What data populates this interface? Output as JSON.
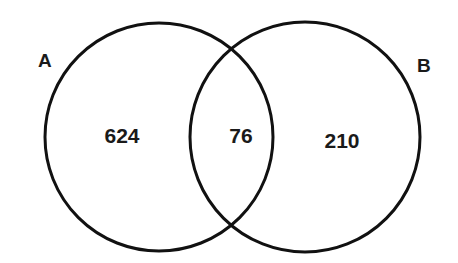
{
  "diagram": {
    "type": "venn",
    "sets": [
      {
        "label": "A",
        "only_count": "624"
      },
      {
        "label": "B",
        "only_count": "210"
      }
    ],
    "intersection": {
      "label": "A∩B",
      "count": "76"
    },
    "colors": {
      "stroke": "#111111",
      "background": "#ffffff",
      "text": "#1a1a1a"
    }
  }
}
